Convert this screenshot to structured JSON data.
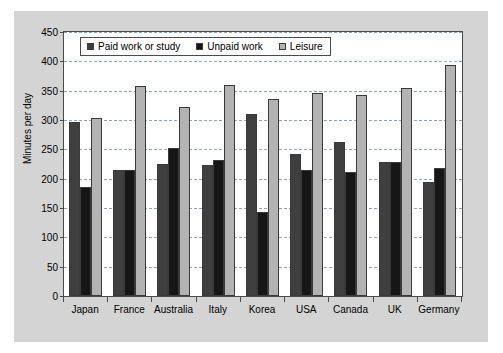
{
  "chart_data": {
    "type": "bar",
    "title": "",
    "xlabel": "",
    "ylabel": "Minutes per day",
    "ylim": [
      0,
      450
    ],
    "ytick_step": 50,
    "yticks": [
      "450",
      "400",
      "350",
      "300",
      "250",
      "200",
      "150",
      "100",
      "50",
      "0"
    ],
    "grid": true,
    "legend_position": "top-left inside plot",
    "categories": [
      "Japan",
      "France",
      "Australia",
      "Italy",
      "Korea",
      "USA",
      "Canada",
      "UK",
      "Germany"
    ],
    "series": [
      {
        "name": "Paid work or study",
        "color": "#3f3f3f",
        "values": [
          297,
          215,
          225,
          223,
          311,
          242,
          263,
          228,
          194
        ]
      },
      {
        "name": "Unpaid work",
        "color": "#161616",
        "values": [
          185,
          215,
          253,
          231,
          144,
          214,
          211,
          228,
          219
        ]
      },
      {
        "name": "Leisure",
        "color": "#b3b3b3",
        "values": [
          303,
          358,
          323,
          360,
          335,
          346,
          342,
          355,
          393
        ]
      }
    ]
  },
  "figure": {
    "background_color": "#d4d4d4",
    "plot_background_color": "#ffffff",
    "axis_color": "#4a4a4a",
    "gridline_color": "#8fa7bd"
  }
}
